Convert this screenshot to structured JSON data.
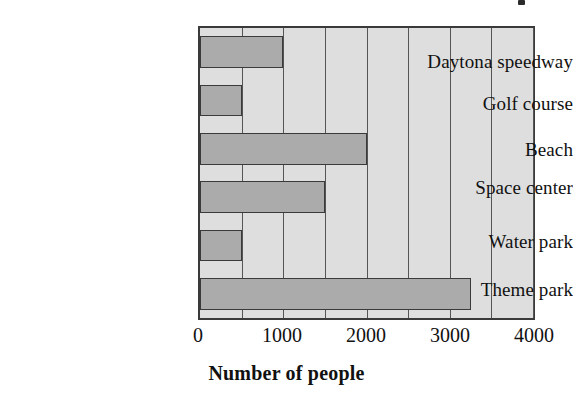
{
  "chart_data": {
    "type": "bar",
    "orientation": "horizontal",
    "title": "",
    "xlabel": "Number of people",
    "ylabel": "",
    "categories": [
      "Daytona speedway",
      "Golf course",
      "Beach",
      "Space center",
      "Water park",
      "Theme park"
    ],
    "values": [
      1000,
      500,
      2000,
      1500,
      500,
      3250
    ],
    "xlim": [
      0,
      4000
    ],
    "xticks": [
      0,
      1000,
      2000,
      3000,
      4000
    ],
    "xtick_labels": [
      "0",
      "1000",
      "2000",
      "3000",
      "4000"
    ],
    "gridlines": [
      0,
      500,
      1000,
      1500,
      2000,
      2500,
      3000,
      3500,
      4000
    ],
    "grid": true,
    "legend": null,
    "bar_color": "#ababab",
    "bar_edge_color": "#3a3a3a",
    "plot_background": "#dedede"
  },
  "axis": {
    "x_title": "Number of people",
    "tick_labels": [
      "0",
      "1000",
      "2000",
      "3000",
      "4000"
    ]
  },
  "categories": [
    {
      "label": "Daytona speedway",
      "value": 1000
    },
    {
      "label": "Golf course",
      "value": 500
    },
    {
      "label": "Beach",
      "value": 2000
    },
    {
      "label": "Space center",
      "value": 1500
    },
    {
      "label": "Water park",
      "value": 500
    },
    {
      "label": "Theme park",
      "value": 3250
    }
  ]
}
